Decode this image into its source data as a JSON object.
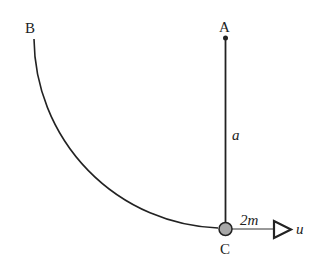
{
  "diagram": {
    "labels": {
      "A": "A",
      "B": "B",
      "C": "C",
      "length": "a",
      "mass": "2m",
      "velocity": "u"
    },
    "colors": {
      "line": "#222222",
      "particle_fill": "#a8a8a8"
    }
  }
}
